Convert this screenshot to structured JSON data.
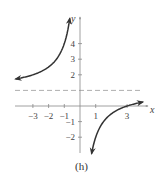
{
  "chart_data": {
    "type": "line",
    "title": "",
    "caption": "(h)",
    "xlabel": "x",
    "ylabel": "y",
    "function": "y = 1 - 3/x",
    "x_ticks": [
      -3,
      -2,
      -1,
      1,
      3
    ],
    "x_tick_labels": [
      "−3",
      "−2",
      "−1",
      "1",
      "3"
    ],
    "y_ticks": [
      4,
      3,
      2,
      -1,
      -2
    ],
    "y_tick_labels": [
      "4",
      "3",
      "2",
      "−1",
      "−2"
    ],
    "xlim": [
      -4.2,
      4.3
    ],
    "ylim": [
      -3,
      5.8
    ],
    "grid": false,
    "asymptotes": {
      "horizontal": {
        "y": 1,
        "style": "dashed"
      },
      "vertical": {
        "x": 0
      }
    },
    "series": [
      {
        "name": "left branch",
        "x": [
          -4.1,
          -3,
          -2,
          -1.5,
          -1,
          -0.8,
          -0.65
        ],
        "y": [
          1.73,
          2,
          2.5,
          3,
          4,
          4.75,
          5.6
        ]
      },
      {
        "name": "right branch",
        "x": [
          0.74,
          1,
          1.5,
          2,
          3,
          4
        ],
        "y": [
          -3.05,
          -2,
          -1,
          -0.5,
          0,
          0.25
        ]
      }
    ],
    "colors": {
      "curve": "#333333",
      "axes": "#888888",
      "asymptote": "#999999"
    }
  }
}
